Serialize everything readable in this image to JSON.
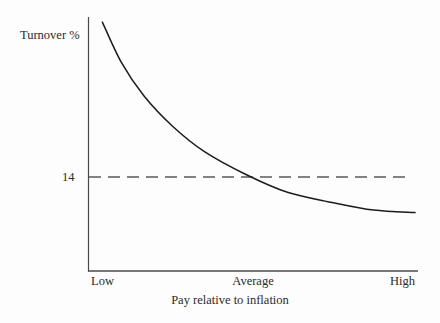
{
  "chart_data": {
    "type": "line",
    "title": "",
    "subtitle": "",
    "xlabel": "Pay relative to inflation",
    "ylabel": "Turnover %",
    "x_tick_labels": [
      "Low",
      "Average",
      "High"
    ],
    "y_tick_labels": [
      "14"
    ],
    "grid": false,
    "legend": null,
    "xlim": [
      0,
      1
    ],
    "ylim": [
      0,
      1
    ],
    "series": [
      {
        "name": "Turnover vs pay",
        "description": "Decaying curve: turnover falls as pay relative to inflation rises",
        "x": [
          "Low",
          "",
          "",
          "",
          "",
          "Average",
          "",
          "",
          "",
          "High"
        ],
        "points": [
          {
            "x": 0.02,
            "y": 0.98
          },
          {
            "x": 0.08,
            "y": 0.82
          },
          {
            "x": 0.15,
            "y": 0.69
          },
          {
            "x": 0.24,
            "y": 0.57
          },
          {
            "x": 0.34,
            "y": 0.47
          },
          {
            "x": 0.47,
            "y": 0.38
          },
          {
            "x": 0.6,
            "y": 0.31
          },
          {
            "x": 0.74,
            "y": 0.27
          },
          {
            "x": 0.87,
            "y": 0.24
          },
          {
            "x": 1.0,
            "y": 0.23
          }
        ]
      }
    ],
    "annotations": [
      {
        "name": "reference-line",
        "type": "horizontal-dashed-line",
        "value_label": "14",
        "y": 0.37,
        "style": "dashed",
        "note": "Dashed reference line at 14% turnover, intersecting the curve at Average pay"
      }
    ],
    "axes": {
      "y_axis_visible": true,
      "x_axis_visible": true,
      "ticks_visible": false
    }
  },
  "axis": {
    "ylabel": "Turnover %",
    "ytick_14": "14",
    "xtick_low": "Low",
    "xtick_average": "Average",
    "xtick_high": "High",
    "xtitle": "Pay relative to inflation"
  },
  "colors": {
    "background": "#fdfdfd",
    "axis": "#4a4a4a",
    "curve": "#1c1c1c",
    "dash": "#5a5a5a",
    "text": "#2b2b2b"
  }
}
